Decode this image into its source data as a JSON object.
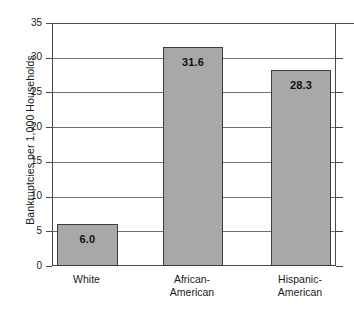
{
  "chart_data": {
    "type": "bar",
    "title": "",
    "xlabel": "",
    "ylabel": "Bankruptcies per 1,000 Households",
    "categories": [
      "White",
      "African-American",
      "Hispanic-American"
    ],
    "category_lines": [
      [
        "White"
      ],
      [
        "African-",
        "American"
      ],
      [
        "Hispanic-",
        "American"
      ]
    ],
    "values": [
      6.0,
      31.6,
      28.3
    ],
    "value_labels": [
      "6.0",
      "31.6",
      "28.3"
    ],
    "ylim": [
      0,
      35
    ],
    "yticks": [
      0,
      5,
      10,
      15,
      20,
      25,
      30,
      35
    ],
    "ytick_labels": [
      "0",
      "5",
      "10",
      "15",
      "20",
      "25",
      "30",
      "35"
    ],
    "grid": true,
    "grid_axis": "y",
    "legend": null,
    "colors": {
      "bar_fill": "#a8a8a8",
      "bar_border": "#3d3d3d",
      "gridline": "#6f6f6f",
      "axis": "#4b4b4b",
      "text": "#1a1a1a",
      "background": "#ffffff"
    }
  }
}
